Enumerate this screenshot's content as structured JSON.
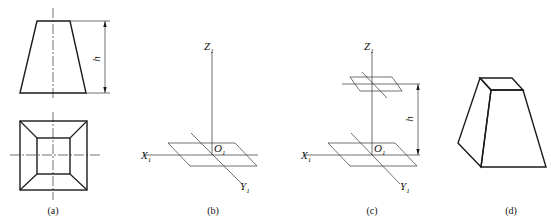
{
  "figure": {
    "panels": [
      {
        "id": "a",
        "caption": "(a)",
        "description": "Two-view orthographic projection of a frustum of a square pyramid",
        "dimension_label": "h"
      },
      {
        "id": "b",
        "caption": "(b)",
        "description": "Axonometric axes with bottom base drawn",
        "axes": {
          "x": "X",
          "y": "Y",
          "z": "Z",
          "origin": "O",
          "subscript": "1"
        }
      },
      {
        "id": "c",
        "caption": "(c)",
        "description": "Top face located at height h along Z axis",
        "axes": {
          "x": "X",
          "y": "Y",
          "z": "Z",
          "origin": "O",
          "subscript": "1"
        },
        "dimension_label": "h"
      },
      {
        "id": "d",
        "caption": "(d)",
        "description": "Finished isometric drawing of the frustum"
      }
    ]
  },
  "colors": {
    "stroke": "#1a1a1a",
    "background": "#ffffff"
  }
}
